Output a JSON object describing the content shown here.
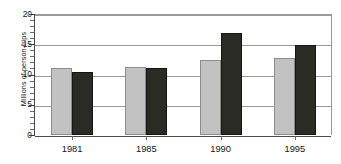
{
  "chart_data": {
    "type": "bar",
    "title": "",
    "xlabel": "",
    "ylabel": "Millions of person-trips",
    "categories": [
      "1981",
      "1985",
      "1990",
      "1995"
    ],
    "series": [
      {
        "name": "series-a",
        "color": "#c2c2c2",
        "values": [
          11.0,
          11.3,
          12.4,
          12.8
        ]
      },
      {
        "name": "series-b",
        "color": "#2b2b26",
        "values": [
          10.4,
          11.0,
          16.9,
          14.8
        ]
      }
    ],
    "ylim": [
      0,
      20
    ],
    "yticks": [
      0,
      5,
      10,
      15,
      20
    ],
    "ytick_labels": [
      "0",
      "5",
      "10",
      "15",
      "20"
    ],
    "y_minor_tick_interval": 1,
    "grid": true,
    "grid_axis": "y",
    "legend": "none",
    "axis_color": "#4a4a4a",
    "grid_color": "#9a9a9a",
    "background": "#ffffff"
  }
}
